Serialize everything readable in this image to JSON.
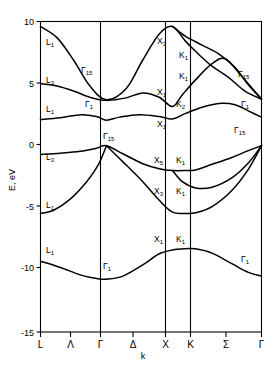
{
  "chart_data": {
    "type": "line",
    "title": "",
    "xlabel": "k",
    "ylabel": "E, eV",
    "ylim": [
      -15,
      10
    ],
    "yticks": [
      10,
      5,
      0,
      -5,
      -10,
      -15
    ],
    "ytick_labels": [
      "10",
      "5",
      "0",
      "-5",
      "-10",
      "-15"
    ],
    "grid": false,
    "legend": "none",
    "xtick_positions": [
      0,
      0.5,
      1,
      1.5,
      2,
      2.35,
      2.85,
      3.35
    ],
    "xtick_labels": [
      "L",
      "Λ",
      "Γ",
      "Δ",
      "X",
      "K",
      "Σ",
      "Γ"
    ],
    "high_symmetry_vlines": [
      "Γ",
      "X",
      "K"
    ],
    "series": [
      {
        "name": "conduction-band-1",
        "points": [
          [
            0,
            9.6
          ],
          [
            0.25,
            8.7
          ],
          [
            0.5,
            6.9
          ],
          [
            0.75,
            4.8
          ],
          [
            1,
            3.7
          ],
          [
            1.3,
            4.6
          ],
          [
            1.55,
            6.9
          ],
          [
            1.8,
            9.0
          ],
          [
            2,
            9.6
          ],
          [
            2.2,
            8.4
          ],
          [
            2.35,
            7.6
          ],
          [
            2.6,
            6.4
          ],
          [
            2.85,
            5.5
          ],
          [
            3.1,
            4.4
          ],
          [
            3.35,
            3.75
          ]
        ]
      },
      {
        "name": "conduction-band-2",
        "points": [
          [
            0,
            5.0
          ],
          [
            0.25,
            4.8
          ],
          [
            0.5,
            4.4
          ],
          [
            0.75,
            3.9
          ],
          [
            1,
            3.65
          ],
          [
            1.3,
            3.85
          ],
          [
            1.55,
            4.25
          ],
          [
            1.8,
            3.9
          ],
          [
            2,
            3.15
          ],
          [
            2.15,
            4.1
          ],
          [
            2.35,
            5.3
          ],
          [
            2.6,
            6.6
          ],
          [
            2.8,
            7.0
          ],
          [
            3.05,
            5.6
          ],
          [
            3.35,
            3.75
          ]
        ]
      },
      {
        "name": "conduction-band-3",
        "points": [
          [
            0,
            2.1
          ],
          [
            0.3,
            2.25
          ],
          [
            0.62,
            2.5
          ],
          [
            0.85,
            2.35
          ],
          [
            1,
            2.05
          ],
          [
            1.2,
            2.3
          ],
          [
            1.5,
            2.5
          ],
          [
            1.8,
            2.35
          ],
          [
            2,
            2.15
          ],
          [
            2.2,
            2.6
          ],
          [
            2.45,
            3.1
          ],
          [
            2.7,
            3.4
          ],
          [
            2.95,
            3.3
          ],
          [
            3.15,
            2.8
          ],
          [
            3.35,
            2.3
          ]
        ]
      },
      {
        "name": "conduction-band-4",
        "points": [
          [
            2,
            9.6
          ],
          [
            2.2,
            8.8
          ],
          [
            2.45,
            8.1
          ],
          [
            2.7,
            7.4
          ],
          [
            2.95,
            6.3
          ],
          [
            3.15,
            4.9
          ],
          [
            3.35,
            3.75
          ]
        ]
      },
      {
        "name": "valence-band-1",
        "points": [
          [
            0,
            -0.7
          ],
          [
            0.3,
            -0.6
          ],
          [
            0.6,
            -0.45
          ],
          [
            0.85,
            -0.2
          ],
          [
            1,
            0.0
          ],
          [
            1.25,
            -0.65
          ],
          [
            1.55,
            -1.45
          ],
          [
            1.8,
            -1.85
          ],
          [
            2,
            -2.0
          ],
          [
            2.2,
            -2.0
          ],
          [
            2.35,
            -1.95
          ],
          [
            2.6,
            -1.5
          ],
          [
            2.9,
            -0.95
          ],
          [
            3.15,
            -0.4
          ],
          [
            3.35,
            0.0
          ]
        ]
      },
      {
        "name": "valence-band-2",
        "points": [
          [
            1,
            0.0
          ],
          [
            1.25,
            -1.3
          ],
          [
            1.55,
            -2.9
          ],
          [
            1.8,
            -4.4
          ],
          [
            2,
            -5.35
          ],
          [
            2.2,
            -5.45
          ],
          [
            2.35,
            -5.4
          ],
          [
            2.6,
            -4.9
          ],
          [
            2.9,
            -3.6
          ],
          [
            3.15,
            -1.9
          ],
          [
            3.35,
            0.0
          ]
        ]
      },
      {
        "name": "valence-band-3",
        "points": [
          [
            2,
            -2.0
          ],
          [
            2.15,
            -2.9
          ],
          [
            2.35,
            -3.4
          ],
          [
            2.6,
            -3.35
          ],
          [
            2.9,
            -2.6
          ],
          [
            3.15,
            -1.4
          ],
          [
            3.35,
            0.0
          ]
        ]
      },
      {
        "name": "valence-band-4",
        "points": [
          [
            0,
            -5.45
          ],
          [
            0.2,
            -5.2
          ],
          [
            0.45,
            -4.3
          ],
          [
            0.7,
            -2.9
          ],
          [
            0.88,
            -1.5
          ],
          [
            1,
            0.0
          ]
        ]
      },
      {
        "name": "valence-band-5-lowest",
        "points": [
          [
            0,
            -9.3
          ],
          [
            0.3,
            -9.8
          ],
          [
            0.6,
            -10.4
          ],
          [
            0.85,
            -10.7
          ],
          [
            1,
            -10.75
          ],
          [
            1.25,
            -10.5
          ],
          [
            1.55,
            -9.6
          ],
          [
            1.8,
            -8.7
          ],
          [
            2,
            -8.4
          ],
          [
            2.2,
            -8.3
          ],
          [
            2.35,
            -8.3
          ],
          [
            2.6,
            -8.65
          ],
          [
            2.9,
            -9.5
          ],
          [
            3.15,
            -10.2
          ],
          [
            3.35,
            -10.5
          ]
        ]
      }
    ],
    "band_labels": [
      {
        "text": "L",
        "sub": "1",
        "x": 46,
        "y": 45
      },
      {
        "text": "L",
        "sub": "3",
        "x": 46,
        "y": 83
      },
      {
        "text": "L",
        "sub": "1",
        "x": 46,
        "y": 112
      },
      {
        "text": "L",
        "sub": "3",
        "x": 46,
        "y": 160
      },
      {
        "text": "L",
        "sub": "1",
        "x": 46,
        "y": 208
      },
      {
        "text": "L",
        "sub": "1",
        "x": 46,
        "y": 253
      },
      {
        "text": "Γ",
        "sub": "15",
        "x": 81,
        "y": 73
      },
      {
        "text": "Γ",
        "sub": "1",
        "x": 85,
        "y": 107
      },
      {
        "text": "Γ",
        "sub": "15",
        "x": 103,
        "y": 139
      },
      {
        "text": "Γ",
        "sub": "1",
        "x": 103,
        "y": 269
      },
      {
        "text": "X",
        "sub": "3",
        "x": 157,
        "y": 44
      },
      {
        "text": "X",
        "sub": "1",
        "x": 157,
        "y": 95
      },
      {
        "text": "X",
        "sub": "1",
        "x": 157,
        "y": 127
      },
      {
        "text": "X",
        "sub": "5",
        "x": 154,
        "y": 163
      },
      {
        "text": "X",
        "sub": "3",
        "x": 154,
        "y": 194
      },
      {
        "text": "X",
        "sub": "1",
        "x": 154,
        "y": 242
      },
      {
        "text": "K",
        "sub": "1",
        "x": 179,
        "y": 58
      },
      {
        "text": "K",
        "sub": "1",
        "x": 179,
        "y": 79
      },
      {
        "text": "K",
        "sub": "2",
        "x": 176,
        "y": 107
      },
      {
        "text": "K",
        "sub": "1",
        "x": 176,
        "y": 163
      },
      {
        "text": "K",
        "sub": "1",
        "x": 176,
        "y": 194
      },
      {
        "text": "K",
        "sub": "1",
        "x": 176,
        "y": 242
      },
      {
        "text": "Γ",
        "sub": "15",
        "x": 238,
        "y": 77
      },
      {
        "text": "Γ",
        "sub": "1",
        "x": 241,
        "y": 107
      },
      {
        "text": "Γ",
        "sub": "15",
        "x": 234,
        "y": 133
      },
      {
        "text": "Γ",
        "sub": "1",
        "x": 241,
        "y": 262
      }
    ]
  },
  "axes": {
    "y_title": "E, eV",
    "x_title": "k"
  }
}
